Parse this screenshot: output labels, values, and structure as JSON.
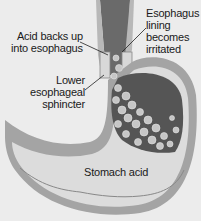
{
  "diagram": {
    "type": "anatomical illustration",
    "labels": {
      "acid_backs_up_line1": "Acid backs up",
      "acid_backs_up_line2": "into esophagus",
      "esophagus_lining_line1": "Esophagus",
      "esophagus_lining_line2": "lining",
      "esophagus_lining_line3": "becomes",
      "esophagus_lining_line4": "irritated",
      "lower_sphincter_line1": "Lower",
      "lower_sphincter_line2": "esophageal",
      "lower_sphincter_line3": "sphincter",
      "stomach_acid": "Stomach acid"
    },
    "colors": {
      "background": "#ececec",
      "stomach_wall": "#9a9a9a",
      "stomach_fill": "#dcdcdc",
      "acid_pool": "#5a5a5a",
      "bubbles": "#c8c8c8"
    }
  }
}
